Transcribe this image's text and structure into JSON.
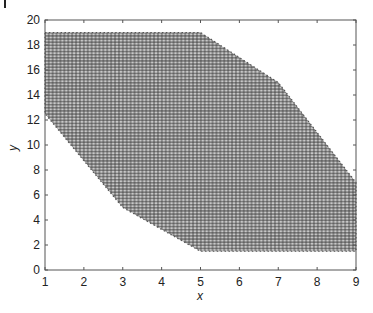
{
  "chart_data": {
    "type": "scatter",
    "title": "",
    "xlabel": "x",
    "ylabel": "y",
    "xlim": [
      1,
      9
    ],
    "ylim": [
      0,
      20
    ],
    "xticks": [
      1,
      2,
      3,
      4,
      5,
      6,
      7,
      8,
      9
    ],
    "yticks": [
      0,
      2,
      4,
      6,
      8,
      10,
      12,
      14,
      16,
      18,
      20
    ],
    "grid": false,
    "legend": null,
    "marker": "+",
    "marker_color": "#3a3a3a",
    "region_vertices": [
      {
        "x": 1,
        "y": 19
      },
      {
        "x": 5,
        "y": 19
      },
      {
        "x": 7,
        "y": 15
      },
      {
        "x": 9,
        "y": 7
      },
      {
        "x": 9,
        "y": 1.5
      },
      {
        "x": 5,
        "y": 1.5
      },
      {
        "x": 3,
        "y": 5
      },
      {
        "x": 1,
        "y": 12.5
      }
    ],
    "grid_step": {
      "x": 0.1,
      "y": 0.25
    }
  },
  "axes": {
    "x_label": "x",
    "y_label": "y"
  }
}
